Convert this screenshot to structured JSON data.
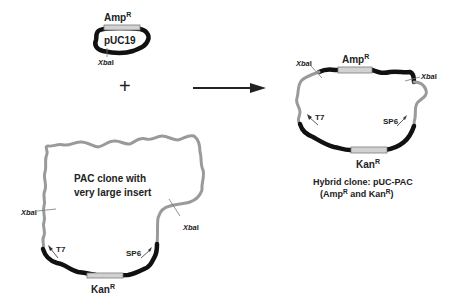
{
  "colors": {
    "backbone": "#111111",
    "insert": "#9a9a9a",
    "gene_box": "#d2d2d2",
    "text": "#222222"
  },
  "operator": "+",
  "arrow": "right-arrow",
  "puc19": {
    "name": "pUC19",
    "gene": "Amp",
    "gene_superscript": "R",
    "site": "XbaI",
    "site_italic": "Xba",
    "site_suffix": "I"
  },
  "pac": {
    "title_line1": "PAC clone with",
    "title_line2": "very large insert",
    "site_left": "XbaI",
    "site_right": "XbaI",
    "site_italic": "Xba",
    "site_suffix": "I",
    "promoter_left": "T7",
    "promoter_right": "SP6",
    "gene": "Kan",
    "gene_superscript": "R"
  },
  "hybrid": {
    "gene_top": "Amp",
    "gene_top_superscript": "R",
    "gene_bottom": "Kan",
    "gene_bottom_superscript": "R",
    "site_italic": "Xba",
    "site_suffix": "I",
    "promoter_left": "T7",
    "promoter_right": "SP6",
    "caption_line1": "Hybrid clone: pUC-PAC",
    "caption_line2_a": "(Amp",
    "caption_line2_sup1": "R",
    "caption_line2_b": " and Kan",
    "caption_line2_sup2": "R",
    "caption_line2_c": ")"
  }
}
